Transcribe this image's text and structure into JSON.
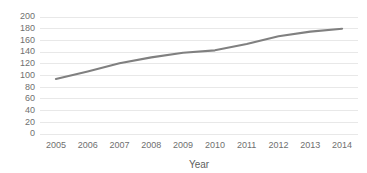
{
  "chart_data": {
    "type": "line",
    "title": "",
    "xlabel": "Year",
    "ylabel": "",
    "categories": [
      "2005",
      "2006",
      "2007",
      "2008",
      "2009",
      "2010",
      "2011",
      "2012",
      "2013",
      "2014"
    ],
    "x": [
      2005,
      2006,
      2007,
      2008,
      2009,
      2010,
      2011,
      2012,
      2013,
      2014
    ],
    "series": [
      {
        "name": "",
        "values": [
          94,
          107,
          121,
          131,
          139,
          143,
          154,
          167,
          175,
          180
        ]
      }
    ],
    "values": [
      94,
      107,
      121,
      131,
      139,
      143,
      154,
      167,
      175,
      180
    ],
    "ylim": [
      0,
      200
    ],
    "yticks": [
      0,
      20,
      40,
      60,
      80,
      100,
      120,
      140,
      160,
      180,
      200
    ],
    "ytick_labels": [
      "0",
      "20",
      "40",
      "60",
      "80",
      "100",
      "120",
      "140",
      "160",
      "180",
      "200"
    ],
    "xtick_labels": [
      "2005",
      "2006",
      "2007",
      "2008",
      "2009",
      "2010",
      "2011",
      "2012",
      "2013",
      "2014"
    ],
    "grid": {
      "horizontal": true,
      "vertical": false,
      "color": "#e2e2e2"
    },
    "legend": {
      "visible": false,
      "position": "none",
      "entries": []
    },
    "colors": {
      "line": "#808080",
      "background": "#ffffff",
      "gridline": "#e2e2e2",
      "tick_label": "#6f6f6f",
      "axis_title": "#5e5e5e"
    },
    "markers": false,
    "annotations": []
  }
}
